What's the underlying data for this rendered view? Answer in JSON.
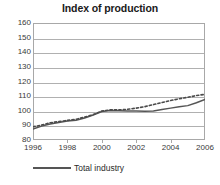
{
  "chart_data": {
    "type": "line",
    "title": "Index of production",
    "xlabel": "",
    "ylabel": "",
    "ylim": [
      80,
      160
    ],
    "yticks": [
      80,
      90,
      100,
      110,
      120,
      130,
      140,
      150,
      160
    ],
    "xlim": [
      1996,
      2006
    ],
    "xticks": [
      1996,
      1998,
      2000,
      2002,
      2004,
      2006
    ],
    "grid": true,
    "legend_position": "bottom-left",
    "x": [
      1996,
      1996.5,
      1997,
      1997.5,
      1998,
      1998.5,
      1999,
      1999.5,
      2000,
      2000.5,
      2001,
      2001.5,
      2002,
      2002.5,
      2003,
      2003.5,
      2004,
      2004.5,
      2005,
      2005.5,
      2006
    ],
    "series": [
      {
        "name": "Total industry",
        "style": "solid",
        "color": "#555555",
        "values": [
          87.5,
          89.5,
          91.0,
          92.0,
          93.0,
          93.5,
          95.0,
          97.0,
          99.5,
          100.2,
          100.0,
          99.8,
          99.8,
          99.7,
          99.8,
          100.8,
          101.8,
          102.8,
          103.5,
          105.5,
          107.8
        ]
      },
      {
        "name": "",
        "style": "dotted",
        "color": "#4a4a4a",
        "values": [
          89.0,
          90.2,
          91.8,
          92.6,
          93.4,
          94.2,
          95.6,
          97.4,
          99.8,
          100.6,
          100.6,
          101.0,
          101.8,
          102.8,
          104.2,
          105.6,
          107.0,
          108.2,
          109.2,
          110.4,
          111.2
        ]
      }
    ]
  },
  "legend": {
    "label": "Total industry"
  }
}
